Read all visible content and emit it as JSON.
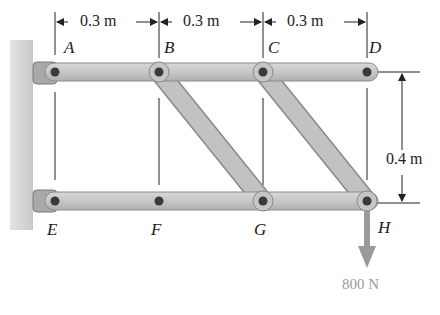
{
  "diagram": {
    "type": "pin-jointed frame",
    "dimensions": {
      "horizontal_spacing": [
        "0.3 m",
        "0.3 m",
        "0.3 m"
      ],
      "vertical_spacing": "0.4 m"
    },
    "joints": {
      "top": [
        "A",
        "B",
        "C",
        "D"
      ],
      "bottom": [
        "E",
        "F",
        "G",
        "H"
      ]
    },
    "members": [
      {
        "from": "A",
        "to": "D",
        "label": "top member AD"
      },
      {
        "from": "E",
        "to": "H",
        "label": "bottom member EH"
      },
      {
        "from": "B",
        "to": "G",
        "label": "diagonal BG"
      },
      {
        "from": "C",
        "to": "H",
        "label": "diagonal CH"
      }
    ],
    "supports": [
      "A",
      "E"
    ],
    "load": {
      "at": "H",
      "value": "800 N",
      "direction": "down"
    },
    "colors": {
      "member": "#c4c4c4",
      "member_edge": "#8a8a8a",
      "pin": "#3a3a3a",
      "wall": "#d9d9d9",
      "load_arrow": "#9a9a9a"
    }
  }
}
